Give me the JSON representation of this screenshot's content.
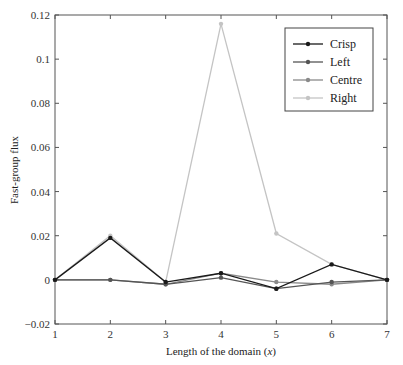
{
  "chart_data": {
    "type": "line",
    "title": "",
    "xlabel": "Length of the domain (x)",
    "xlabel_parts": {
      "prefix": "Length of the domain (",
      "var": "x",
      "suffix": ")"
    },
    "ylabel": "Fast-group flux",
    "x": [
      1,
      2,
      3,
      4,
      5,
      6,
      7
    ],
    "xlim": [
      1,
      7
    ],
    "ylim": [
      -0.02,
      0.12
    ],
    "xticks": [
      "1",
      "2",
      "3",
      "4",
      "5",
      "6",
      "7"
    ],
    "yticks": [
      -0.02,
      0,
      0.02,
      0.04,
      0.06,
      0.08,
      0.1,
      0.12
    ],
    "ytick_labels": [
      "−0.02",
      "0",
      "0.02",
      "0.04",
      "0.06",
      "0.08",
      "0.1",
      "0.12"
    ],
    "grid": false,
    "legend_position": "upper right",
    "series": [
      {
        "name": "Crisp",
        "color": "#1a1a1a",
        "values": [
          0,
          0.019,
          -0.001,
          0.003,
          -0.004,
          0.007,
          0
        ]
      },
      {
        "name": "Left",
        "color": "#555555",
        "values": [
          0,
          0.0,
          -0.002,
          0.001,
          -0.004,
          -0.001,
          0
        ]
      },
      {
        "name": "Centre",
        "color": "#8a8a8a",
        "values": [
          0,
          0.0,
          -0.002,
          0.003,
          -0.001,
          -0.002,
          0
        ]
      },
      {
        "name": "Right",
        "color": "#c4c4c4",
        "values": [
          0,
          0.02,
          -0.001,
          0.116,
          0.021,
          0.007,
          0
        ]
      }
    ]
  }
}
